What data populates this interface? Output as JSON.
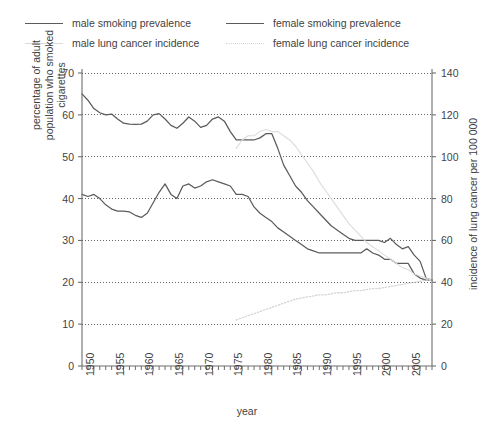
{
  "legend": {
    "items": [
      {
        "label": "male smoking prevalence",
        "style": "solid",
        "color": "#5b5b5b",
        "pos": "left-top"
      },
      {
        "label": "male lung cancer incidence",
        "style": "solid",
        "color": "#dcdcdc",
        "pos": "left-bottom"
      },
      {
        "label": "female smoking prevalence",
        "style": "solid",
        "color": "#5b5b5b",
        "pos": "right-top"
      },
      {
        "label": "female lung cancer incidence",
        "style": "dotted",
        "color": "#d6d6d6",
        "pos": "right-bottom"
      }
    ]
  },
  "axes": {
    "x": {
      "title": "year",
      "min": 1948,
      "max": 2007,
      "tick_step": 1,
      "label_step": 5,
      "labels": [
        "1950",
        "1955",
        "1960",
        "1965",
        "1970",
        "1975",
        "1980",
        "1985",
        "1990",
        "1995",
        "2000",
        "2005"
      ],
      "label_values": [
        1950,
        1955,
        1960,
        1965,
        1970,
        1975,
        1980,
        1985,
        1990,
        1995,
        2000,
        2005
      ]
    },
    "y_left": {
      "title": "percentage of adult population who smoked cigarettes",
      "min": 0,
      "max": 70,
      "step": 10,
      "labels": [
        "0",
        "10",
        "20",
        "30",
        "40",
        "50",
        "60",
        "70"
      ]
    },
    "y_right": {
      "title": "incidence of lung cancer per 100 000",
      "min": 0,
      "max": 140,
      "step": 20,
      "labels": [
        "0",
        "20",
        "40",
        "60",
        "80",
        "100",
        "120",
        "140"
      ]
    },
    "grid": "dotted-horizontal"
  },
  "chart_data": {
    "type": "line",
    "title": "",
    "xlabel": "year",
    "ylabel": "percentage of adult population who smoked cigarettes",
    "ylabel_right": "incidence of lung cancer per 100 000",
    "xlim": [
      1948,
      2007
    ],
    "ylim": [
      0,
      70
    ],
    "ylim_right": [
      0,
      140
    ],
    "grid": true,
    "legend_position": "top",
    "series": [
      {
        "name": "male smoking prevalence",
        "axis": "left",
        "unit": "percent",
        "style": "solid",
        "color": "#5b5b5b",
        "x": [
          1948,
          1949,
          1950,
          1951,
          1952,
          1953,
          1954,
          1955,
          1956,
          1957,
          1958,
          1959,
          1960,
          1961,
          1962,
          1963,
          1964,
          1965,
          1966,
          1967,
          1968,
          1969,
          1970,
          1971,
          1972,
          1973,
          1974,
          1975,
          1976,
          1977,
          1978,
          1979,
          1980,
          1981,
          1982,
          1983,
          1984,
          1985,
          1986,
          1987,
          1988,
          1989,
          1990,
          1991,
          1992,
          1993,
          1994,
          1995,
          1996,
          1997,
          1998,
          1999,
          2000,
          2001,
          2002,
          2003,
          2004,
          2005,
          2006,
          2007
        ],
        "y": [
          65.0,
          63.5,
          61.5,
          60.5,
          60.0,
          60.2,
          59.0,
          58.0,
          57.8,
          57.7,
          57.8,
          58.5,
          60.0,
          60.3,
          59.0,
          57.5,
          56.8,
          58.0,
          59.5,
          58.5,
          57.0,
          57.5,
          59.0,
          59.5,
          58.5,
          56.0,
          54.0,
          54.0,
          54.0,
          54.0,
          54.5,
          55.5,
          55.5,
          52.0,
          48.0,
          45.5,
          43.0,
          41.5,
          39.5,
          38.0,
          36.5,
          35.0,
          33.5,
          32.5,
          31.5,
          30.5,
          30.0,
          30.0,
          30.0,
          30.0,
          30.0,
          29.5,
          30.5,
          29.0,
          28.0,
          28.5,
          26.5,
          25.0,
          21.0,
          20.5
        ]
      },
      {
        "name": "female smoking prevalence",
        "axis": "left",
        "unit": "percent",
        "style": "solid",
        "color": "#5b5b5b",
        "x": [
          1948,
          1949,
          1950,
          1951,
          1952,
          1953,
          1954,
          1955,
          1956,
          1957,
          1958,
          1959,
          1960,
          1961,
          1962,
          1963,
          1964,
          1965,
          1966,
          1967,
          1968,
          1969,
          1970,
          1971,
          1972,
          1973,
          1974,
          1975,
          1976,
          1977,
          1978,
          1979,
          1980,
          1981,
          1982,
          1983,
          1984,
          1985,
          1986,
          1987,
          1988,
          1989,
          1990,
          1991,
          1992,
          1993,
          1994,
          1995,
          1996,
          1997,
          1998,
          1999,
          2000,
          2001,
          2002,
          2003,
          2004,
          2005,
          2006,
          2007
        ],
        "y": [
          41.0,
          40.5,
          41.0,
          40.0,
          38.5,
          37.5,
          37.0,
          37.0,
          36.8,
          36.0,
          35.5,
          36.5,
          39.0,
          41.5,
          43.5,
          41.0,
          40.0,
          43.0,
          43.5,
          42.5,
          43.0,
          44.0,
          44.5,
          44.0,
          43.5,
          43.0,
          41.0,
          41.0,
          40.5,
          38.0,
          36.5,
          35.5,
          34.5,
          33.0,
          32.0,
          31.0,
          30.0,
          29.0,
          28.0,
          27.5,
          27.0,
          27.0,
          27.0,
          27.0,
          27.0,
          27.0,
          27.0,
          27.0,
          28.0,
          27.0,
          26.5,
          25.5,
          25.5,
          24.5,
          24.5,
          24.5,
          22.0,
          21.0,
          20.5,
          20.5
        ]
      },
      {
        "name": "male lung cancer incidence",
        "axis": "right",
        "unit": "per 100 000",
        "style": "solid",
        "color": "#dcdcdc",
        "x": [
          1974,
          1975,
          1976,
          1977,
          1978,
          1979,
          1980,
          1981,
          1982,
          1983,
          1984,
          1985,
          1986,
          1987,
          1988,
          1989,
          1990,
          1991,
          1992,
          1993,
          1994,
          1995,
          1996,
          1997,
          1998,
          1999,
          2000,
          2001,
          2002,
          2003,
          2004,
          2005,
          2006,
          2007
        ],
        "y": [
          104,
          108,
          110,
          110,
          112,
          113,
          112,
          112,
          110,
          108,
          105,
          101,
          97,
          93,
          88,
          84,
          80,
          76,
          72,
          68,
          65,
          62,
          59,
          57,
          55,
          53,
          51,
          49,
          47,
          46,
          44,
          43,
          42,
          41
        ]
      },
      {
        "name": "female lung cancer incidence",
        "axis": "right",
        "unit": "per 100 000",
        "style": "dotted",
        "color": "#d6d6d6",
        "x": [
          1974,
          1975,
          1976,
          1977,
          1978,
          1979,
          1980,
          1981,
          1982,
          1983,
          1984,
          1985,
          1986,
          1987,
          1988,
          1989,
          1990,
          1991,
          1992,
          1993,
          1994,
          1995,
          1996,
          1997,
          1998,
          1999,
          2000,
          2001,
          2002,
          2003,
          2004,
          2005,
          2006,
          2007
        ],
        "y": [
          22,
          23,
          24,
          25,
          26,
          27,
          28,
          29,
          30,
          31,
          32,
          32.5,
          33,
          33.5,
          34,
          34,
          34.5,
          35,
          35,
          35.5,
          36,
          36,
          36.5,
          37,
          37,
          37.5,
          38,
          38.5,
          39,
          39.5,
          40,
          40.5,
          41,
          41
        ]
      }
    ]
  }
}
